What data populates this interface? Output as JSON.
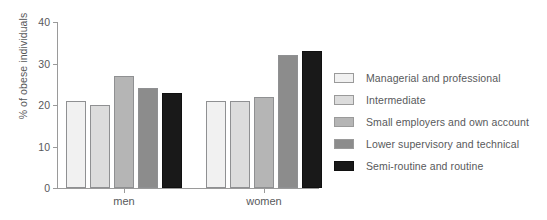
{
  "chart_data": {
    "type": "bar",
    "title": "",
    "subtitle": "",
    "xlabel": "",
    "ylabel": "% of obese individuals",
    "categories": [
      "men",
      "women"
    ],
    "ylim": [
      0,
      40
    ],
    "yticks": [
      0,
      10,
      20,
      30,
      40
    ],
    "ytick_labels": [
      "0",
      "10",
      "20",
      "30",
      "40"
    ],
    "grid": false,
    "legend_position": "right",
    "series": [
      {
        "name": "Managerial and professional",
        "color": "#f1f1f1",
        "values": [
          21,
          21
        ]
      },
      {
        "name": "Intermediate",
        "color": "#dcdcdc",
        "values": [
          20,
          21
        ]
      },
      {
        "name": "Small employers and own account",
        "color": "#b5b5b5",
        "values": [
          27,
          22
        ]
      },
      {
        "name": "Lower supervisory and technical",
        "color": "#8c8c8c",
        "values": [
          24,
          32
        ]
      },
      {
        "name": "Semi-routine and routine",
        "color": "#191919",
        "values": [
          23,
          33
        ]
      }
    ]
  },
  "axis": {
    "line_color": "#9a9a9a",
    "text_color": "#58595b"
  }
}
